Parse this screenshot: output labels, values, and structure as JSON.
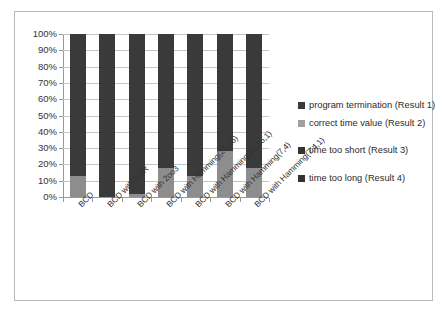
{
  "chart_data": {
    "type": "bar",
    "subtype": "stacked-percent",
    "title": "",
    "xlabel": "",
    "ylabel": "",
    "ylim": [
      0,
      100
    ],
    "ytick_labels": [
      "100%",
      "90%",
      "80%",
      "70%",
      "60%",
      "50%",
      "40%",
      "30%",
      "20%",
      "10%",
      "0%"
    ],
    "ytick_values": [
      100,
      90,
      80,
      70,
      60,
      50,
      40,
      30,
      20,
      10,
      0
    ],
    "grid": true,
    "legend_position": "right",
    "categories": [
      "BCD",
      "BCD with XOR",
      "BCD with 2oo3",
      "BCD with Hamming(21,16)",
      "BCD with Hamming(21,16,1)",
      "BCD with Hamming(7,4)",
      "BCD with Hamming(7,4,1)"
    ],
    "series": [
      {
        "name": "time too long (Result 4)",
        "color": "#3a3a3a",
        "values": [
          0,
          0,
          0,
          0,
          0,
          0,
          0
        ]
      },
      {
        "name": "time too short (Result 3)",
        "color": "#3a3a3a",
        "values": [
          0,
          0,
          0,
          0,
          0,
          0,
          0
        ]
      },
      {
        "name": "correct time value (Result 2)",
        "color": "#8d8d8d",
        "values": [
          13,
          0,
          2,
          18,
          13,
          28,
          18
        ]
      },
      {
        "name": "program termination (Result 1)",
        "color": "#3a3a3a",
        "values": [
          87,
          100,
          98,
          82,
          87,
          72,
          82
        ]
      }
    ],
    "legend": [
      {
        "label": "program termination (Result 1)",
        "color": "#3a3a3a"
      },
      {
        "label": "correct time value (Result 2)",
        "color": "#a0a0a0"
      },
      {
        "label": "time too short (Result 3)",
        "color": "#333333"
      },
      {
        "label": "time too long (Result 4)",
        "color": "#333333"
      }
    ]
  },
  "colors": {
    "frame_border": "#b9b9b9",
    "gridline": "#c4c4c4",
    "axis": "#9a9a9a",
    "text": "#333333",
    "background": "#ffffff",
    "dark_segment": "#3a3a3a",
    "light_segment": "#8d8d8d"
  }
}
